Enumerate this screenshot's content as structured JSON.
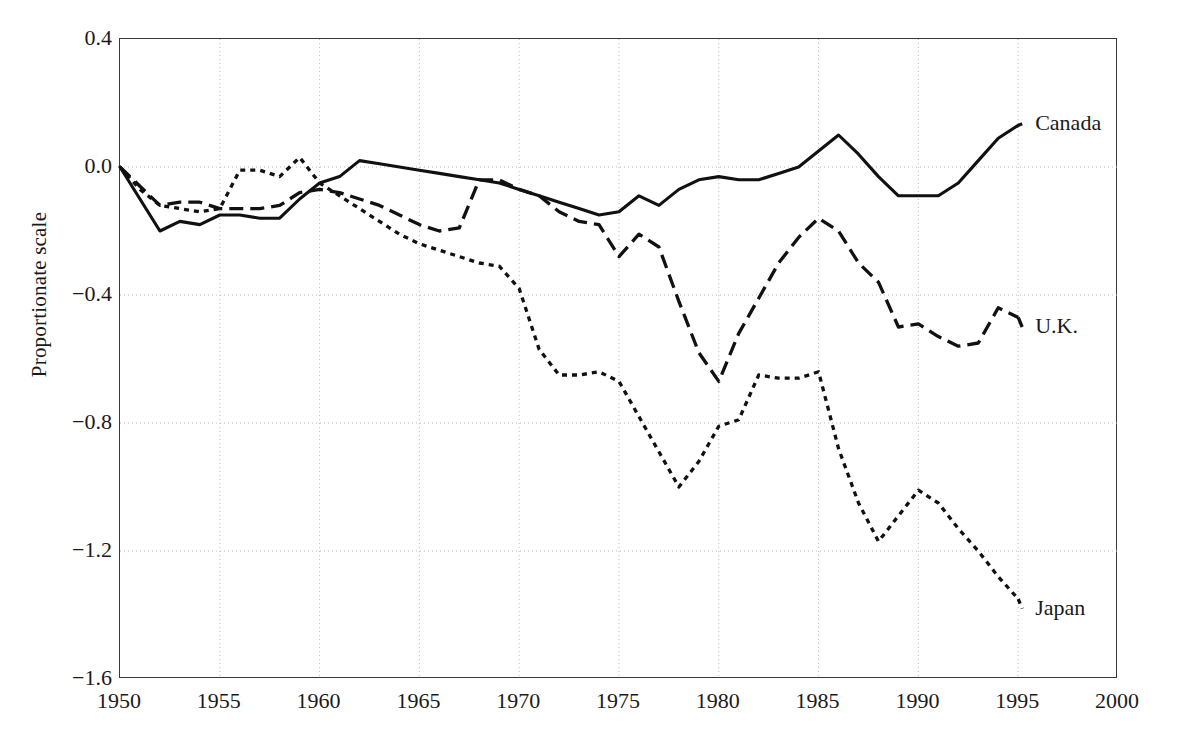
{
  "chart_data": {
    "type": "line",
    "title": "",
    "subtitle": "",
    "xlabel": "",
    "ylabel": "Proportionate scale",
    "xlim": [
      1950,
      2000
    ],
    "ylim": [
      -1.6,
      0.4
    ],
    "xticks": [
      1950,
      1955,
      1960,
      1965,
      1970,
      1975,
      1980,
      1985,
      1990,
      1995,
      2000
    ],
    "xtick_labels": [
      "1950",
      "1955",
      "1960",
      "1965",
      "1970",
      "1975",
      "1980",
      "1985",
      "1990",
      "1995",
      "2000"
    ],
    "yticks": [
      0.4,
      0.0,
      -0.4,
      -0.8,
      -1.2,
      -1.6
    ],
    "ytick_labels": [
      "0.4",
      "0.0",
      "−0.4",
      "−0.8",
      "−1.2",
      "−1.6"
    ],
    "grid": true,
    "grid_style": "dotted",
    "grid_color": "#bdbdbd",
    "legend_position": "inline-right",
    "line_color": "#111111",
    "background": "#ffffff",
    "series": [
      {
        "name": "Canada",
        "label": "Canada",
        "dash": "solid",
        "label_x": 1995.5,
        "label_y": 0.135,
        "x": [
          1950,
          1951,
          1952,
          1953,
          1954,
          1955,
          1956,
          1957,
          1958,
          1959,
          1960,
          1961,
          1962,
          1963,
          1964,
          1965,
          1966,
          1967,
          1968,
          1969,
          1970,
          1971,
          1972,
          1973,
          1974,
          1975,
          1976,
          1977,
          1978,
          1979,
          1980,
          1981,
          1982,
          1983,
          1984,
          1985,
          1986,
          1987,
          1988,
          1989,
          1990,
          1991,
          1992,
          1993,
          1994,
          1995
        ],
        "y": [
          0.0,
          -0.1,
          -0.2,
          -0.17,
          -0.18,
          -0.15,
          -0.15,
          -0.16,
          -0.16,
          -0.1,
          -0.05,
          -0.03,
          0.02,
          0.01,
          0.0,
          -0.01,
          -0.02,
          -0.03,
          -0.04,
          -0.05,
          -0.07,
          -0.09,
          -0.11,
          -0.13,
          -0.15,
          -0.14,
          -0.09,
          -0.12,
          -0.07,
          -0.04,
          -0.03,
          -0.04,
          -0.04,
          -0.02,
          0.0,
          0.05,
          0.1,
          0.04,
          -0.03,
          -0.09,
          -0.09,
          -0.09,
          -0.05,
          0.02,
          0.09,
          0.13
        ]
      },
      {
        "name": "U.K.",
        "label": "U.K.",
        "dash": "long-dash",
        "label_x": 1995.5,
        "label_y": -0.5,
        "x": [
          1950,
          1951,
          1952,
          1953,
          1954,
          1955,
          1956,
          1957,
          1958,
          1959,
          1960,
          1961,
          1962,
          1963,
          1964,
          1965,
          1966,
          1967,
          1968,
          1969,
          1970,
          1971,
          1972,
          1973,
          1974,
          1975,
          1976,
          1977,
          1978,
          1979,
          1980,
          1981,
          1982,
          1983,
          1984,
          1985,
          1986,
          1987,
          1988,
          1989,
          1990,
          1991,
          1992,
          1993,
          1994,
          1995
        ],
        "y": [
          0.0,
          -0.06,
          -0.12,
          -0.11,
          -0.11,
          -0.13,
          -0.13,
          -0.13,
          -0.12,
          -0.08,
          -0.07,
          -0.08,
          -0.1,
          -0.12,
          -0.15,
          -0.18,
          -0.2,
          -0.19,
          -0.04,
          -0.04,
          -0.07,
          -0.09,
          -0.14,
          -0.17,
          -0.18,
          -0.28,
          -0.21,
          -0.25,
          -0.42,
          -0.58,
          -0.67,
          -0.52,
          -0.41,
          -0.3,
          -0.22,
          -0.16,
          -0.2,
          -0.3,
          -0.36,
          -0.5,
          -0.49,
          -0.53,
          -0.56,
          -0.55,
          -0.44,
          -0.47
        ]
      },
      {
        "name": "Japan",
        "label": "Japan",
        "dash": "short-dash",
        "label_x": 1995.5,
        "label_y": -1.38,
        "x": [
          1950,
          1951,
          1952,
          1953,
          1954,
          1955,
          1956,
          1957,
          1958,
          1959,
          1960,
          1961,
          1962,
          1963,
          1964,
          1965,
          1966,
          1967,
          1968,
          1969,
          1970,
          1971,
          1972,
          1973,
          1974,
          1975,
          1976,
          1977,
          1978,
          1979,
          1980,
          1981,
          1982,
          1983,
          1984,
          1985,
          1986,
          1987,
          1988,
          1989,
          1990,
          1991,
          1992,
          1993,
          1994,
          1995
        ],
        "y": [
          0.0,
          -0.07,
          -0.12,
          -0.13,
          -0.14,
          -0.13,
          -0.01,
          -0.01,
          -0.03,
          0.03,
          -0.05,
          -0.09,
          -0.13,
          -0.17,
          -0.21,
          -0.24,
          -0.26,
          -0.28,
          -0.3,
          -0.31,
          -0.38,
          -0.57,
          -0.65,
          -0.65,
          -0.64,
          -0.67,
          -0.78,
          -0.89,
          -1.0,
          -0.92,
          -0.81,
          -0.79,
          -0.65,
          -0.66,
          -0.66,
          -0.64,
          -0.88,
          -1.05,
          -1.17,
          -1.09,
          -1.01,
          -1.05,
          -1.13,
          -1.2,
          -1.28,
          -1.35
        ]
      }
    ]
  }
}
